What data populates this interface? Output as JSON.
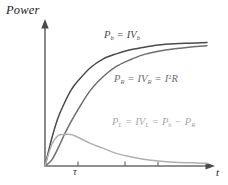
{
  "figure": {
    "background": "#ffffff",
    "axis_color": "#6b6b6b"
  },
  "axes": {
    "ylabel": "Power",
    "xlabel": "t",
    "x_ticks": [
      {
        "label": "τ",
        "x": 78
      },
      {
        "label": "",
        "x": 125
      },
      {
        "label": "",
        "x": 158
      }
    ]
  },
  "labels": {
    "pb": {
      "p": "P",
      "p_sub": "b",
      "eq": "=",
      "iv": "IV",
      "iv_sub": "b"
    },
    "pr": {
      "p": "P",
      "p_sub": "R",
      "eq1": "=",
      "iv": "IV",
      "iv_sub": "R",
      "eq2": "=",
      "i": "I",
      "i_sup": "2",
      "r": "R"
    },
    "pl": {
      "p": "P",
      "p_sub": "L",
      "eq1": "=",
      "iv": "IV",
      "iv_sub": "L",
      "eq2": "=",
      "pb": "P",
      "pb_sub": "b",
      "minus": "−",
      "pr": "P",
      "pr_sub": "R"
    }
  },
  "chart_data": {
    "type": "line",
    "title": "",
    "xlabel": "t",
    "ylabel": "Power",
    "xlim": [
      0,
      1
    ],
    "ylim": [
      0,
      1
    ],
    "grid": false,
    "legend": "inline-annotations",
    "x_tick_labels": [
      "τ",
      "",
      ""
    ],
    "x_tick_values": [
      0.2,
      0.48,
      0.67
    ],
    "series": [
      {
        "name": "P_b = IV_b",
        "color": "#4a4a4a",
        "description": "Battery power, saturating exponential rise 1-exp(-t/tau)",
        "x": [
          0.0,
          0.04,
          0.08,
          0.12,
          0.16,
          0.2,
          0.28,
          0.36,
          0.44,
          0.52,
          0.6,
          0.7,
          0.8,
          0.9,
          1.0
        ],
        "y": [
          0.0,
          0.21,
          0.38,
          0.5,
          0.6,
          0.67,
          0.78,
          0.85,
          0.89,
          0.92,
          0.94,
          0.96,
          0.97,
          0.975,
          0.98
        ]
      },
      {
        "name": "P_R = IV_R = I^2R",
        "color": "#6e6e6e",
        "description": "Resistor power, proportional to square of rising current",
        "x": [
          0.0,
          0.04,
          0.08,
          0.12,
          0.16,
          0.2,
          0.28,
          0.36,
          0.44,
          0.52,
          0.6,
          0.7,
          0.8,
          0.9,
          1.0
        ],
        "y": [
          0.0,
          0.045,
          0.14,
          0.25,
          0.35,
          0.44,
          0.6,
          0.71,
          0.79,
          0.84,
          0.88,
          0.91,
          0.93,
          0.945,
          0.955
        ]
      },
      {
        "name": "P_L = IV_L = P_b - P_R",
        "color": "#b0b0b0",
        "description": "Inductor power, rises to a peak near tau then decays to zero",
        "x": [
          0.0,
          0.04,
          0.08,
          0.12,
          0.16,
          0.2,
          0.28,
          0.36,
          0.44,
          0.52,
          0.6,
          0.7,
          0.8,
          0.9,
          1.0
        ],
        "y": [
          0.0,
          0.165,
          0.24,
          0.25,
          0.25,
          0.23,
          0.18,
          0.14,
          0.1,
          0.075,
          0.055,
          0.04,
          0.03,
          0.025,
          0.02
        ]
      }
    ]
  }
}
